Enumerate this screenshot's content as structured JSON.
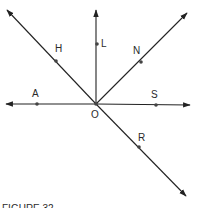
{
  "figure": {
    "caption": "FIGURE 32",
    "origin": {
      "label": "O",
      "x": 96,
      "y": 104
    },
    "colors": {
      "line": "#222222",
      "point": "#444444",
      "text": "#2a2a2a"
    },
    "rays": [
      {
        "name": "ray-OH",
        "tip": [
          7,
          10
        ]
      },
      {
        "name": "ray-OL",
        "tip": [
          96,
          10
        ]
      },
      {
        "name": "ray-ON",
        "tip": [
          187,
          13
        ]
      },
      {
        "name": "ray-OA",
        "tip": [
          6,
          104
        ]
      },
      {
        "name": "ray-OS",
        "tip": [
          190,
          105
        ]
      },
      {
        "name": "ray-OR",
        "tip": [
          186,
          196
        ]
      }
    ],
    "points": [
      {
        "label": "H",
        "x": 56,
        "y": 61,
        "lx": 55,
        "ly": 52
      },
      {
        "label": "L",
        "x": 97,
        "y": 44,
        "lx": 101,
        "ly": 47
      },
      {
        "label": "N",
        "x": 141,
        "y": 62,
        "lx": 133,
        "ly": 54
      },
      {
        "label": "A",
        "x": 37,
        "y": 104,
        "lx": 32,
        "ly": 97
      },
      {
        "label": "S",
        "x": 156,
        "y": 105,
        "lx": 151,
        "ly": 98
      },
      {
        "label": "R",
        "x": 139,
        "y": 147,
        "lx": 138,
        "ly": 141
      }
    ]
  }
}
